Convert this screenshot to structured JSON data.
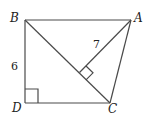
{
  "diagram": {
    "type": "geometry",
    "vertices": {
      "A": {
        "label": "A",
        "x": 131,
        "y": 20
      },
      "B": {
        "label": "B",
        "x": 25,
        "y": 20
      },
      "C": {
        "label": "C",
        "x": 110,
        "y": 103
      },
      "D": {
        "label": "D",
        "x": 25,
        "y": 103
      }
    },
    "segments": [
      "AB",
      "BD",
      "DC",
      "CA",
      "BC",
      "A-foot"
    ],
    "lengths": {
      "BD": "6",
      "A_to_BC": "7"
    },
    "right_angles": [
      "D",
      "foot of perpendicular from A to BC"
    ],
    "line_color": "#444444"
  }
}
